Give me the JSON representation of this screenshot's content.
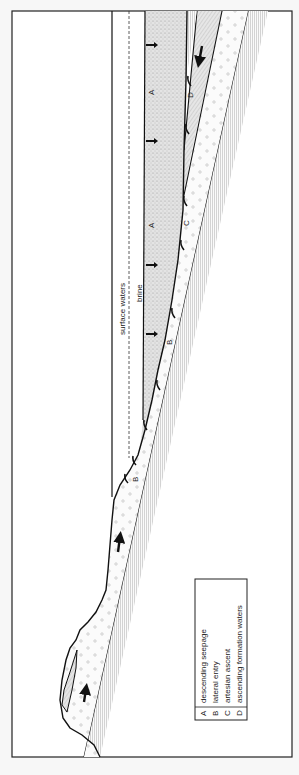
{
  "figure": {
    "orientation": "rotated 90 degrees counter-clockwise",
    "water_labels": {
      "surface_waters": "surface waters",
      "brine": "brine"
    },
    "flow_labels": {
      "A_top": "A",
      "A_mid": "A",
      "D": "D",
      "C": "C",
      "B_mid": "B",
      "B_shore": "B"
    },
    "legend": {
      "items": [
        {
          "key": "A",
          "text": "descending seepage"
        },
        {
          "key": "B",
          "text": "lateral entry"
        },
        {
          "key": "C",
          "text": "artesian ascent"
        },
        {
          "key": "D",
          "text": "ascending formation waters"
        }
      ]
    },
    "colors": {
      "background": "#f7f7f7",
      "line": "#1a1a1a",
      "stipple": "#d8d8d8",
      "hatch": "#9a9a9a"
    }
  }
}
